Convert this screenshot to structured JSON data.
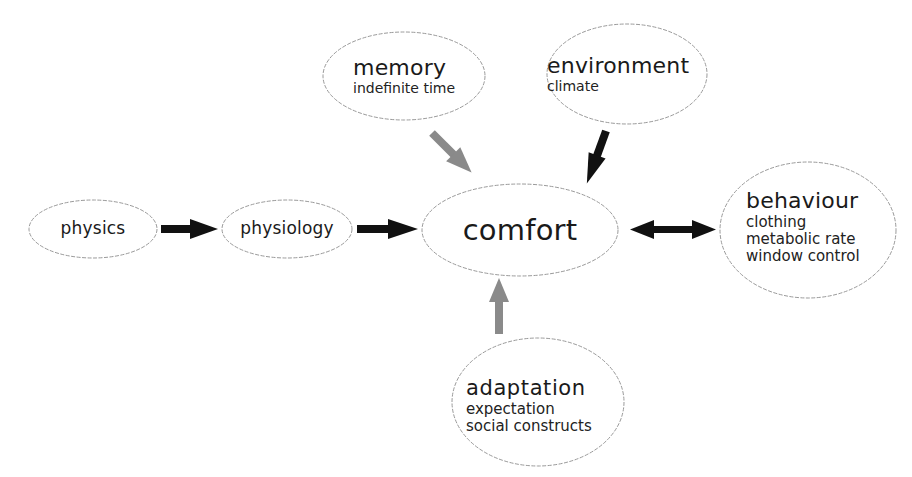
{
  "diagram": {
    "nodes": {
      "physics": {
        "title": "physics"
      },
      "physiology": {
        "title": "physiology"
      },
      "comfort": {
        "title": "comfort"
      },
      "memory": {
        "title": "memory",
        "subtitle": "indefinite time"
      },
      "environment": {
        "title": "environment",
        "subtitle": "climate"
      },
      "behaviour": {
        "title": "behaviour",
        "items": [
          "clothing",
          "metabolic rate",
          "window control"
        ]
      },
      "adaptation": {
        "title": "adaptation",
        "items": [
          "expectation",
          "social constructs"
        ]
      }
    },
    "edges": [
      {
        "from": "physics",
        "to": "physiology",
        "style": "black"
      },
      {
        "from": "physiology",
        "to": "comfort",
        "style": "black"
      },
      {
        "from": "memory",
        "to": "comfort",
        "style": "gray"
      },
      {
        "from": "environment",
        "to": "comfort",
        "style": "black"
      },
      {
        "from": "comfort",
        "to": "behaviour",
        "style": "black",
        "bidirectional": true
      },
      {
        "from": "adaptation",
        "to": "comfort",
        "style": "gray"
      }
    ],
    "colors": {
      "black_arrow": "#111111",
      "gray_arrow": "#8a8a8a",
      "outline": "#9a9a9a"
    }
  }
}
